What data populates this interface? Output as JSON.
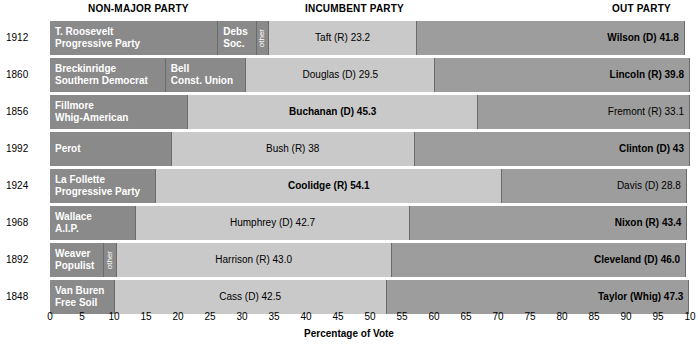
{
  "headers": {
    "nonmajor": "NON-MAJOR PARTY",
    "incumbent": "INCUMBENT PARTY",
    "outparty": "OUT PARTY"
  },
  "axis": {
    "label": "Percentage of Vote",
    "ticks": [
      "0",
      "5",
      "10",
      "15",
      "20",
      "25",
      "30",
      "35",
      "40",
      "45",
      "50",
      "55",
      "60",
      "65",
      "70",
      "75",
      "80",
      "85",
      "90",
      "95",
      "10"
    ],
    "min": 0,
    "max": 100
  },
  "colors": {
    "nonmajor_fill": "#8a8a8a",
    "incumbent_fill": "#c9c9c9",
    "out_fill": "#9d9d9d",
    "border": "#6b6b6b",
    "background": "#ffffff"
  },
  "chart_data": {
    "type": "bar",
    "orientation": "horizontal-stacked",
    "title": "",
    "xlabel": "Percentage of Vote",
    "ylabel": "",
    "xlim": [
      0,
      100
    ],
    "grid": false,
    "categories": [
      "1912",
      "1860",
      "1856",
      "1992",
      "1924",
      "1968",
      "1892",
      "1848"
    ],
    "rows": [
      {
        "year": "1912",
        "segments": [
          {
            "name": "T. Roosevelt Progressive Party",
            "label_line1": "T. Roosevelt",
            "label_line2": "Progressive Party",
            "value": 26.3,
            "group": "non-major",
            "text_color": "white",
            "align": "left",
            "bold": false
          },
          {
            "name": "Debs Soc.",
            "label_line1": "Debs",
            "label_line2": "Soc.",
            "value": 6.0,
            "group": "non-major",
            "text_color": "white",
            "align": "left",
            "bold": false
          },
          {
            "name": "other",
            "label_line1": "other",
            "label_line2": "",
            "value": 1.9,
            "group": "non-major",
            "text_color": "white",
            "align": "center",
            "vertical": true,
            "bold": false
          },
          {
            "name": "Taft (R)",
            "label_line1": "Taft (R) 23.2",
            "label_line2": "",
            "value": 23.2,
            "group": "incumbent",
            "text_color": "black",
            "align": "center",
            "bold": false
          },
          {
            "name": "Wilson (D)",
            "label_line1": "Wilson (D) 41.8",
            "label_line2": "",
            "value": 41.8,
            "group": "out",
            "text_color": "black",
            "align": "right",
            "bold": true
          }
        ]
      },
      {
        "year": "1860",
        "segments": [
          {
            "name": "Breckinridge Southern Democrat",
            "label_line1": "Breckinridge",
            "label_line2": "Southern Democrat",
            "value": 18.1,
            "group": "non-major",
            "text_color": "white",
            "align": "left",
            "bold": false
          },
          {
            "name": "Bell Const. Union",
            "label_line1": "Bell",
            "label_line2": "Const. Union",
            "value": 12.6,
            "group": "non-major",
            "text_color": "white",
            "align": "left",
            "bold": false
          },
          {
            "name": "Douglas (D)",
            "label_line1": "Douglas (D) 29.5",
            "label_line2": "",
            "value": 29.5,
            "group": "incumbent",
            "text_color": "black",
            "align": "center",
            "bold": false
          },
          {
            "name": "Lincoln (R)",
            "label_line1": "Lincoln (R) 39.8",
            "label_line2": "",
            "value": 39.8,
            "group": "out",
            "text_color": "black",
            "align": "right",
            "bold": true
          }
        ]
      },
      {
        "year": "1856",
        "segments": [
          {
            "name": "Fillmore Whig-American",
            "label_line1": "Fillmore",
            "label_line2": "Whig-American",
            "value": 21.6,
            "group": "non-major",
            "text_color": "white",
            "align": "left",
            "bold": false
          },
          {
            "name": "Buchanan (D)",
            "label_line1": "Buchanan (D) 45.3",
            "label_line2": "",
            "value": 45.3,
            "group": "incumbent",
            "text_color": "black",
            "align": "center",
            "bold": true
          },
          {
            "name": "Fremont (R)",
            "label_line1": "Fremont (R) 33.1",
            "label_line2": "",
            "value": 33.1,
            "group": "out",
            "text_color": "black",
            "align": "right",
            "bold": false
          }
        ]
      },
      {
        "year": "1992",
        "segments": [
          {
            "name": "Perot",
            "label_line1": "Perot",
            "label_line2": "",
            "value": 19.0,
            "group": "non-major",
            "text_color": "white",
            "align": "left",
            "bold": false
          },
          {
            "name": "Bush (R)",
            "label_line1": "Bush (R) 38",
            "label_line2": "",
            "value": 38.0,
            "group": "incumbent",
            "text_color": "black",
            "align": "center",
            "bold": false
          },
          {
            "name": "Clinton (D)",
            "label_line1": "Clinton (D) 43",
            "label_line2": "",
            "value": 43.0,
            "group": "out",
            "text_color": "black",
            "align": "right",
            "bold": true
          }
        ]
      },
      {
        "year": "1924",
        "segments": [
          {
            "name": "La Follette Progressive Party",
            "label_line1": "La Follette",
            "label_line2": "Progressive Party",
            "value": 16.6,
            "group": "non-major",
            "text_color": "white",
            "align": "left",
            "bold": false
          },
          {
            "name": "Coolidge (R)",
            "label_line1": "Coolidge (R) 54.1",
            "label_line2": "",
            "value": 54.1,
            "group": "incumbent",
            "text_color": "black",
            "align": "center",
            "bold": true
          },
          {
            "name": "Davis (D)",
            "label_line1": "Davis (D) 28.8",
            "label_line2": "",
            "value": 28.8,
            "group": "out",
            "text_color": "black",
            "align": "right",
            "bold": false
          }
        ]
      },
      {
        "year": "1968",
        "segments": [
          {
            "name": "Wallace A.I.P.",
            "label_line1": "Wallace",
            "label_line2": "A.I.P.",
            "value": 13.5,
            "group": "non-major",
            "text_color": "white",
            "align": "left",
            "bold": false
          },
          {
            "name": "Humphrey (D)",
            "label_line1": "Humphrey (D) 42.7",
            "label_line2": "",
            "value": 42.7,
            "group": "incumbent",
            "text_color": "black",
            "align": "center",
            "bold": false
          },
          {
            "name": "Nixon (R)",
            "label_line1": "Nixon (R) 43.4",
            "label_line2": "",
            "value": 43.4,
            "group": "out",
            "text_color": "black",
            "align": "right",
            "bold": true
          }
        ]
      },
      {
        "year": "1892",
        "segments": [
          {
            "name": "Weaver Populist",
            "label_line1": "Weaver",
            "label_line2": "Populist",
            "value": 8.5,
            "group": "non-major",
            "text_color": "white",
            "align": "left",
            "bold": false
          },
          {
            "name": "other",
            "label_line1": "other",
            "label_line2": "",
            "value": 1.9,
            "group": "non-major",
            "text_color": "white",
            "align": "center",
            "vertical": true,
            "bold": false
          },
          {
            "name": "Harrison (R)",
            "label_line1": "Harrison (R) 43.0",
            "label_line2": "",
            "value": 43.0,
            "group": "incumbent",
            "text_color": "black",
            "align": "center",
            "bold": false
          },
          {
            "name": "Cleveland (D)",
            "label_line1": "Cleveland (D) 46.0",
            "label_line2": "",
            "value": 46.0,
            "group": "out",
            "text_color": "black",
            "align": "right",
            "bold": true
          }
        ]
      },
      {
        "year": "1848",
        "segments": [
          {
            "name": "Van Buren Free Soil",
            "label_line1": "Van Buren",
            "label_line2": "Free Soil",
            "value": 10.1,
            "group": "non-major",
            "text_color": "white",
            "align": "left",
            "bold": false
          },
          {
            "name": "Cass (D)",
            "label_line1": "Cass (D) 42.5",
            "label_line2": "",
            "value": 42.5,
            "group": "incumbent",
            "text_color": "black",
            "align": "center",
            "bold": false
          },
          {
            "name": "Taylor (Whig)",
            "label_line1": "Taylor (Whig) 47.3",
            "label_line2": "",
            "value": 47.3,
            "group": "out",
            "text_color": "black",
            "align": "right",
            "bold": true
          }
        ]
      }
    ]
  }
}
